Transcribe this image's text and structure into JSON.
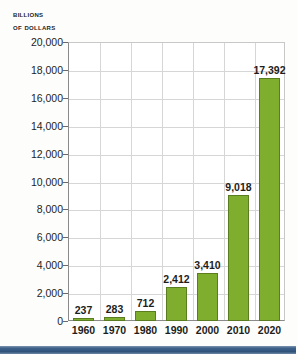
{
  "chart_data": {
    "type": "bar",
    "title": "",
    "axis_title_line1": "Billions",
    "axis_title_line2": "of dollars",
    "xlabel": "",
    "ylabel": "Billions of dollars",
    "categories": [
      "1960",
      "1970",
      "1980",
      "1990",
      "2000",
      "2010",
      "2020"
    ],
    "values": [
      237,
      283,
      712,
      2412,
      3410,
      9018,
      17392
    ],
    "value_labels": [
      "237",
      "283",
      "712",
      "2,412",
      "3,410",
      "9,018",
      "17,392"
    ],
    "ylim": [
      0,
      20000
    ],
    "ytick_values": [
      0,
      2000,
      4000,
      6000,
      8000,
      10000,
      12000,
      14000,
      16000,
      18000,
      20000
    ],
    "ytick_labels": [
      "0",
      "2,000",
      "4,000",
      "6,000",
      "8,000",
      "10,000",
      "12,000",
      "14,000",
      "16,000",
      "18,000",
      "20,000"
    ],
    "grid": true,
    "legend": "none",
    "bar_color": "#7fae2f",
    "bar_border_color": "#5b7d22",
    "grid_color": "#d6d6d6",
    "axis_color": "#8a8a8a",
    "text_color": "#1d1d1b",
    "plot_background": "#ffffff",
    "page_background": "#fdfdfb",
    "footer_band_color": "#3d6289"
  }
}
